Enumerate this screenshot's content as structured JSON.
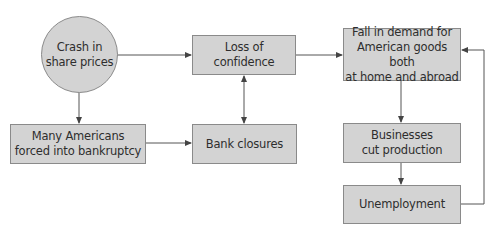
{
  "diagram": {
    "colors": {
      "node_fill": "#d3d3d3",
      "node_border": "#8a8a8a",
      "text": "#2e2e2e",
      "edge": "#555555"
    },
    "nodes": {
      "crash": {
        "label": "Crash in\nshare prices",
        "shape": "circle"
      },
      "confidence": {
        "label": "Loss of confidence",
        "shape": "rect"
      },
      "demand": {
        "label": "Fall in demand for\nAmerican goods both\nat home and abroad",
        "shape": "rect"
      },
      "bankruptcy": {
        "label": "Many Americans\nforced into bankruptcy",
        "shape": "rect"
      },
      "banks": {
        "label": "Bank closures",
        "shape": "rect"
      },
      "production": {
        "label": "Businesses\ncut production",
        "shape": "rect"
      },
      "unemployment": {
        "label": "Unemployment",
        "shape": "rect"
      }
    },
    "edges": [
      {
        "from": "crash",
        "to": "confidence",
        "direction": "forward"
      },
      {
        "from": "crash",
        "to": "bankruptcy",
        "direction": "forward"
      },
      {
        "from": "confidence",
        "to": "demand",
        "direction": "forward"
      },
      {
        "from": "bankruptcy",
        "to": "banks",
        "direction": "forward"
      },
      {
        "from": "confidence",
        "to": "banks",
        "direction": "both"
      },
      {
        "from": "demand",
        "to": "production",
        "direction": "forward"
      },
      {
        "from": "production",
        "to": "unemployment",
        "direction": "forward"
      },
      {
        "from": "unemployment",
        "to": "demand",
        "direction": "forward"
      }
    ]
  }
}
